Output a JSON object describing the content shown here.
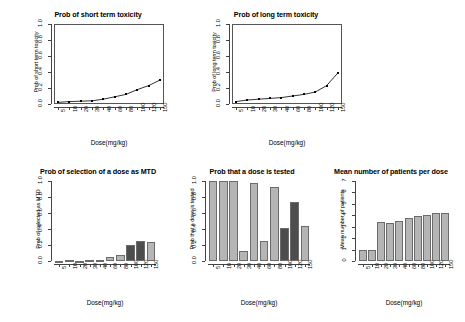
{
  "figure": {
    "background": "#ffffff",
    "panel_count": 4
  },
  "labels": {
    "xlab": "Dose(mg/kg)",
    "doses": [
      "5",
      "10",
      "20",
      "30",
      "40",
      "60",
      "80",
      "100",
      "120",
      "150"
    ]
  },
  "panels": {
    "short_term": {
      "title": "Prob of short term toxicity",
      "ylabel": "Prob of short term toxicity",
      "xlabel": "Dose(mg/kg)",
      "yticks": [
        "0.0",
        "0.2",
        "0.4",
        "0.6",
        "0.8",
        "1.0"
      ]
    },
    "long_term": {
      "title": "Prob of long term toxicity",
      "ylabel": "Prob of long term toxicity",
      "xlabel": "Dose(mg/kg)",
      "yticks": [
        "0.0",
        "0.2",
        "0.4",
        "0.6",
        "0.8",
        "1.0"
      ]
    },
    "mtd": {
      "title": "Prob of selection of a dose as MTD",
      "ylabel": "Prob of selected as MTD",
      "xlabel": "Dose(mg/kg)",
      "yticks": [
        "0.0",
        "0.2",
        "0.4",
        "0.6",
        "0.8",
        "1.0"
      ]
    },
    "tested": {
      "title": "Prob that a dose is tested",
      "ylabel": "Prob that a dose is tested",
      "xlabel": "Dose(mg/kg)",
      "yticks": [
        "0.0",
        "0.2",
        "0.4",
        "0.6",
        "0.8",
        "1.0"
      ]
    },
    "patients": {
      "title": "Mean number of patients per dose",
      "ylabel": "Mean number of patients",
      "xlabel": "Dose(mg/kg)",
      "yticks": [
        "0",
        "1",
        "2",
        "3",
        "4",
        "5",
        "6",
        "7"
      ]
    }
  },
  "colors": {
    "bar_light": "#b5b5b5",
    "bar_dark": "#4d4d4d",
    "bar_border": "#6b6b6b",
    "axis": "#444444",
    "line": "#000000",
    "text": "#000000"
  },
  "chart_data": [
    {
      "type": "line",
      "id": "short_term_toxicity",
      "title": "Prob of short term toxicity",
      "xlabel": "Dose(mg/kg)",
      "ylabel": "Prob of short term toxicity",
      "x": [
        5,
        10,
        20,
        30,
        40,
        60,
        80,
        100,
        120,
        150
      ],
      "categories": [
        "5",
        "10",
        "20",
        "30",
        "40",
        "60",
        "80",
        "100",
        "120",
        "150"
      ],
      "values": [
        0.02,
        0.03,
        0.035,
        0.04,
        0.06,
        0.09,
        0.12,
        0.18,
        0.23,
        0.3
      ],
      "ylim": [
        0.0,
        1.0
      ],
      "grid": false,
      "legend": "none",
      "markers": "filled-square"
    },
    {
      "type": "line",
      "id": "long_term_toxicity",
      "title": "Prob of long term toxicity",
      "xlabel": "Dose(mg/kg)",
      "ylabel": "Prob of long term toxicity",
      "x": [
        5,
        10,
        20,
        30,
        40,
        60,
        80,
        100,
        120,
        150
      ],
      "categories": [
        "5",
        "10",
        "20",
        "30",
        "40",
        "60",
        "80",
        "100",
        "120",
        "150"
      ],
      "values": [
        0.03,
        0.05,
        0.06,
        0.07,
        0.08,
        0.1,
        0.12,
        0.15,
        0.23,
        0.39
      ],
      "ylim": [
        0.0,
        1.0
      ],
      "grid": false,
      "legend": "none",
      "markers": "filled-square"
    },
    {
      "type": "bar",
      "id": "prob_selection_mtd",
      "title": "Prob of selection of a dose as MTD",
      "xlabel": "Dose(mg/kg)",
      "ylabel": "Prob of selected as MTD",
      "categories": [
        "5",
        "10",
        "20",
        "30",
        "40",
        "60",
        "80",
        "100",
        "120",
        "150"
      ],
      "values": [
        0.0,
        0.015,
        0.0,
        0.015,
        0.013,
        0.05,
        0.08,
        0.2,
        0.245,
        0.235
      ],
      "ylim": [
        0.0,
        1.0
      ],
      "grid": false,
      "legend": "none",
      "bar_shades": [
        "light",
        "light",
        "light",
        "light",
        "light",
        "light",
        "light",
        "dark",
        "dark",
        "light"
      ]
    },
    {
      "type": "bar",
      "id": "prob_dose_tested",
      "title": "Prob that a dose is tested",
      "xlabel": "Dose(mg/kg)",
      "ylabel": "Prob that a dose is tested",
      "categories": [
        "5",
        "10",
        "20",
        "30",
        "40",
        "60",
        "80",
        "100",
        "120",
        "150"
      ],
      "values": [
        1.0,
        1.0,
        1.0,
        0.13,
        0.97,
        0.25,
        0.93,
        0.41,
        0.74,
        0.44
      ],
      "ylim": [
        0.0,
        1.0
      ],
      "grid": false,
      "legend": "none",
      "bar_shades": [
        "light",
        "light",
        "light",
        "light",
        "light",
        "light",
        "light",
        "dark",
        "dark",
        "light"
      ]
    },
    {
      "type": "bar",
      "id": "mean_patients_per_dose",
      "title": "Mean number of patients per dose",
      "xlabel": "Dose(mg/kg)",
      "ylabel": "Mean number of patients",
      "categories": [
        "5",
        "10",
        "20",
        "30",
        "40",
        "60",
        "80",
        "100",
        "120",
        "150"
      ],
      "values": [
        1.0,
        1.0,
        3.4,
        3.35,
        3.5,
        3.75,
        3.9,
        4.0,
        4.2,
        4.18
      ],
      "ylim": [
        0,
        7
      ],
      "grid": false,
      "legend": "none",
      "bar_shades": [
        "light",
        "light",
        "light",
        "light",
        "light",
        "light",
        "light",
        "light",
        "light",
        "light"
      ]
    }
  ]
}
